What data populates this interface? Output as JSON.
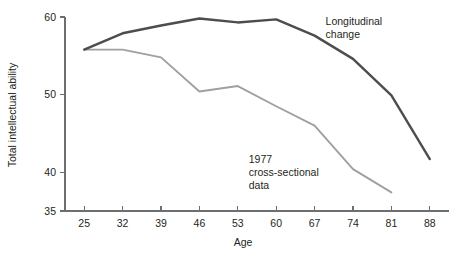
{
  "chart_data": {
    "type": "line",
    "title": "",
    "xlabel": "Age",
    "ylabel": "Total intellectual ability",
    "x": [
      25,
      32,
      39,
      46,
      53,
      60,
      67,
      74,
      81,
      88
    ],
    "xticklabels": [
      "25",
      "32",
      "39",
      "46",
      "53",
      "60",
      "67",
      "74",
      "81",
      "88"
    ],
    "yticks": [
      35,
      40,
      50,
      60
    ],
    "yticklabels": [
      "35",
      "40",
      "50",
      "60"
    ],
    "xlim": [
      21.5,
      91.5
    ],
    "ylim": [
      35,
      60
    ],
    "grid": false,
    "legend_position": "inline-annotations",
    "series": [
      {
        "name": "Longitudinal change",
        "color": "#4d4d4d",
        "x": [
          25,
          32,
          39,
          46,
          53,
          60,
          67,
          74,
          81,
          88
        ],
        "values": [
          55.8,
          57.9,
          58.9,
          59.8,
          59.3,
          59.7,
          57.6,
          54.6,
          49.9,
          41.7
        ]
      },
      {
        "name": "1977 cross-sectional data",
        "color": "#a0a0a0",
        "x": [
          25,
          32,
          39,
          46,
          53,
          60,
          67,
          74,
          81
        ],
        "values": [
          55.8,
          55.8,
          54.8,
          50.4,
          51.1,
          48.5,
          46.0,
          40.4,
          37.4
        ]
      }
    ],
    "annotations": [
      {
        "id": "longitudinal-label",
        "lines": [
          "Longitudinal",
          "change"
        ],
        "x": 69,
        "y": 59.0
      },
      {
        "id": "cross-sectional-label",
        "lines": [
          "1977",
          "cross-sectional",
          "data"
        ],
        "x": 55,
        "y": 41.2
      }
    ]
  },
  "axes": {
    "y_title": "Total intellectual ability",
    "x_title": "Age"
  }
}
